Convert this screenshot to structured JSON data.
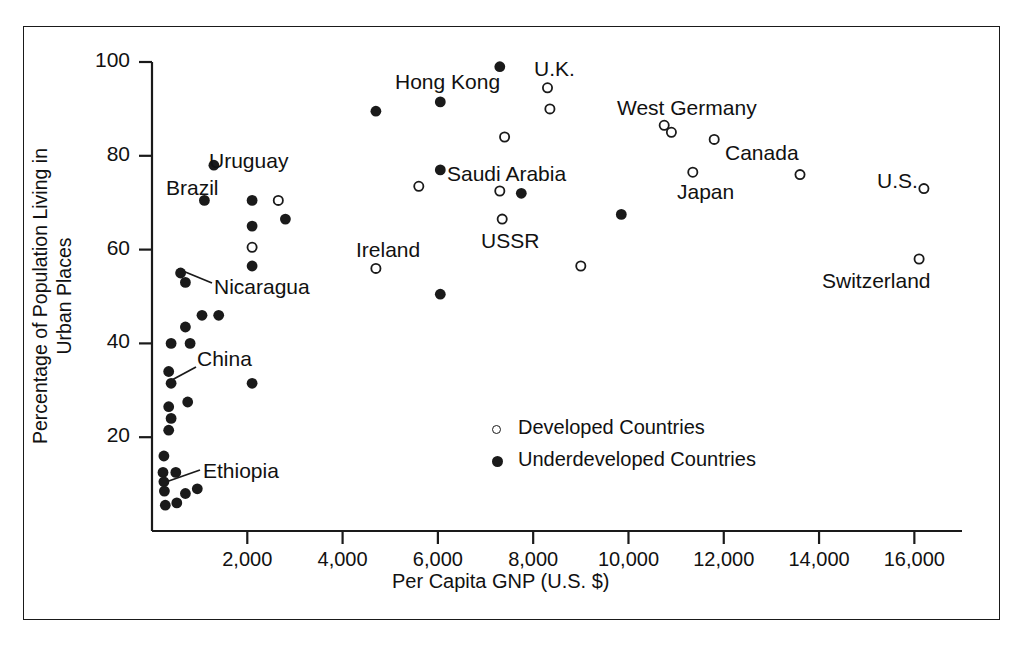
{
  "figure": {
    "background": "#ffffff",
    "ink": "#1a1a1a",
    "has_outer_frame": true
  },
  "chart_data": {
    "type": "scatter",
    "title": "",
    "xlabel": "Per Capita GNP (U.S. $)",
    "ylabel": "Percentage of Population Living in Urban Places",
    "xlim": [
      0,
      17000
    ],
    "ylim": [
      0,
      103
    ],
    "grid": false,
    "legend_position": "center-right-inside",
    "xticks": [
      2000,
      4000,
      6000,
      8000,
      10000,
      12000,
      14000,
      16000
    ],
    "xticklabels": [
      "2,000",
      "4,000",
      "6,000",
      "8,000",
      "10,000",
      "12,000",
      "14,000",
      "16,000"
    ],
    "yticks": [
      20,
      40,
      60,
      80,
      100
    ],
    "yticklabels": [
      "20",
      "40",
      "60",
      "80",
      "100"
    ],
    "series": [
      {
        "name": "Developed Countries",
        "marker": "open-circle",
        "points": [
          {
            "x": 2650,
            "y": 70.5
          },
          {
            "x": 2100,
            "y": 60.5
          },
          {
            "x": 4700,
            "y": 56.0
          },
          {
            "x": 5600,
            "y": 73.5
          },
          {
            "x": 7300,
            "y": 72.5
          },
          {
            "x": 7350,
            "y": 66.5
          },
          {
            "x": 7400,
            "y": 84.0
          },
          {
            "x": 8300,
            "y": 94.5
          },
          {
            "x": 8350,
            "y": 90.0
          },
          {
            "x": 9000,
            "y": 56.5
          },
          {
            "x": 10750,
            "y": 86.5
          },
          {
            "x": 10900,
            "y": 85.0
          },
          {
            "x": 11350,
            "y": 76.5
          },
          {
            "x": 11800,
            "y": 83.5
          },
          {
            "x": 13600,
            "y": 76.0
          },
          {
            "x": 16200,
            "y": 73.0
          },
          {
            "x": 16100,
            "y": 58.0
          }
        ]
      },
      {
        "name": "Underdeveloped Countries",
        "marker": "filled-circle",
        "points": [
          {
            "x": 7300,
            "y": 99.0
          },
          {
            "x": 6050,
            "y": 91.5
          },
          {
            "x": 4700,
            "y": 89.5
          },
          {
            "x": 1300,
            "y": 78.0
          },
          {
            "x": 6050,
            "y": 77.0
          },
          {
            "x": 7750,
            "y": 72.0
          },
          {
            "x": 1100,
            "y": 70.5
          },
          {
            "x": 2100,
            "y": 70.5
          },
          {
            "x": 2800,
            "y": 66.5
          },
          {
            "x": 9850,
            "y": 67.5
          },
          {
            "x": 2100,
            "y": 65.0
          },
          {
            "x": 2100,
            "y": 56.5
          },
          {
            "x": 600,
            "y": 55.0
          },
          {
            "x": 700,
            "y": 53.0
          },
          {
            "x": 6050,
            "y": 50.5
          },
          {
            "x": 1050,
            "y": 46.0
          },
          {
            "x": 1400,
            "y": 46.0
          },
          {
            "x": 700,
            "y": 43.5
          },
          {
            "x": 400,
            "y": 40.0
          },
          {
            "x": 800,
            "y": 40.0
          },
          {
            "x": 350,
            "y": 34.0
          },
          {
            "x": 400,
            "y": 31.5
          },
          {
            "x": 2100,
            "y": 31.5
          },
          {
            "x": 350,
            "y": 26.5
          },
          {
            "x": 750,
            "y": 27.5
          },
          {
            "x": 400,
            "y": 24.0
          },
          {
            "x": 350,
            "y": 21.5
          },
          {
            "x": 250,
            "y": 16.0
          },
          {
            "x": 230,
            "y": 12.5
          },
          {
            "x": 500,
            "y": 12.5
          },
          {
            "x": 250,
            "y": 10.5
          },
          {
            "x": 260,
            "y": 8.5
          },
          {
            "x": 700,
            "y": 8.0
          },
          {
            "x": 950,
            "y": 9.0
          },
          {
            "x": 280,
            "y": 5.5
          },
          {
            "x": 520,
            "y": 6.0
          }
        ]
      }
    ],
    "annotations": [
      {
        "text": "Hong Kong",
        "x_px": 395,
        "y_px": 84,
        "anchor": "left"
      },
      {
        "text": "U.K.",
        "x_px": 534,
        "y_px": 71,
        "anchor": "left"
      },
      {
        "text": "West Germany",
        "x_px": 617,
        "y_px": 110,
        "anchor": "left"
      },
      {
        "text": "Uruguay",
        "x_px": 209,
        "y_px": 163,
        "anchor": "left"
      },
      {
        "text": "Brazil",
        "x_px": 166,
        "y_px": 190,
        "anchor": "left"
      },
      {
        "text": "Saudi Arabia",
        "x_px": 447,
        "y_px": 176,
        "anchor": "left"
      },
      {
        "text": "Canada",
        "x_px": 725,
        "y_px": 155,
        "anchor": "left"
      },
      {
        "text": "Japan",
        "x_px": 677,
        "y_px": 194,
        "anchor": "left"
      },
      {
        "text": "U.S.",
        "x_px": 877,
        "y_px": 183,
        "anchor": "left"
      },
      {
        "text": "Ireland",
        "x_px": 356,
        "y_px": 252,
        "anchor": "left"
      },
      {
        "text": "USSR",
        "x_px": 481,
        "y_px": 243,
        "anchor": "left"
      },
      {
        "text": "Switzerland",
        "x_px": 822,
        "y_px": 283,
        "anchor": "left"
      },
      {
        "text": "Nicaragua",
        "x_px": 214,
        "y_px": 289,
        "anchor": "left"
      },
      {
        "text": "China",
        "x_px": 197,
        "y_px": 361,
        "anchor": "left"
      },
      {
        "text": "Ethiopia",
        "x_px": 203,
        "y_px": 473,
        "anchor": "left"
      }
    ],
    "leader_lines": [
      {
        "label": "Nicaragua",
        "x1_px": 212,
        "y1_px": 283,
        "x2_px": 178,
        "y2_px": 269
      },
      {
        "label": "China",
        "x1_px": 196,
        "y1_px": 367,
        "x2_px": 170,
        "y2_px": 381
      },
      {
        "label": "Ethiopia",
        "x1_px": 200,
        "y1_px": 470,
        "x2_px": 163,
        "y2_px": 483
      }
    ],
    "legend": [
      {
        "marker": "open-circle",
        "label": "Developed Countries"
      },
      {
        "marker": "filled-circle",
        "label": "Underdeveloped Countries"
      }
    ]
  }
}
